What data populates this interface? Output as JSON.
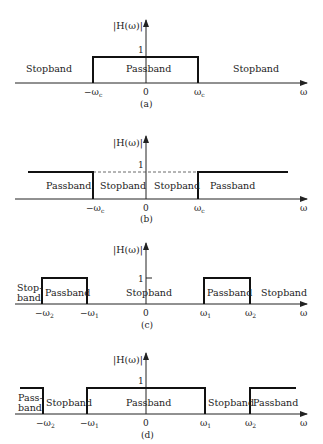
{
  "figure": {
    "y_axis_label": "|H(ω)|",
    "x_axis_label": "ω",
    "unit_level_label": "1",
    "origin_label": "0"
  },
  "panels": [
    {
      "caption": "(a)",
      "type": "lowpass",
      "tick_labels": [
        "−ω",
        "0",
        "ω"
      ],
      "tick_subscripts": [
        "c",
        "",
        "c"
      ],
      "band_labels": [
        "Stopband",
        "Passband",
        "Stopband"
      ]
    },
    {
      "caption": "(b)",
      "type": "highpass",
      "tick_labels": [
        "−ω",
        "0",
        "ω"
      ],
      "tick_subscripts": [
        "c",
        "",
        "c"
      ],
      "band_labels": [
        "Passband",
        "Stopband",
        "Stopband",
        "Passband"
      ]
    },
    {
      "caption": "(c)",
      "type": "bandpass",
      "tick_labels": [
        "−ω",
        "−ω",
        "0",
        "ω",
        "ω"
      ],
      "tick_subscripts": [
        "2",
        "1",
        "",
        "1",
        "2"
      ],
      "band_labels": [
        "Stop-",
        "band",
        "Passband",
        "Stopband",
        "Passband",
        "Stopband"
      ]
    },
    {
      "caption": "(d)",
      "type": "bandstop",
      "tick_labels": [
        "−ω",
        "−ω",
        "0",
        "ω",
        "ω"
      ],
      "tick_subscripts": [
        "2",
        "1",
        "",
        "1",
        "2"
      ],
      "band_labels": [
        "Pass-",
        "band",
        "Stopband",
        "Passband",
        "Stopband",
        "Passband"
      ]
    }
  ]
}
